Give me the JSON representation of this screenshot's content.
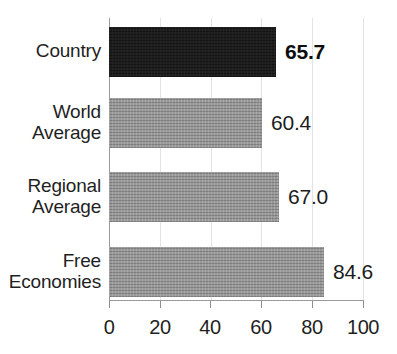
{
  "chart_data": {
    "type": "bar",
    "orientation": "horizontal",
    "title": "",
    "subtitle": "",
    "xlabel": "",
    "ylabel": "",
    "xlim": [
      0,
      100
    ],
    "xticks": [
      "0",
      "20",
      "40",
      "60",
      "80",
      "100"
    ],
    "grid": true,
    "legend": null,
    "categories": [
      "Country",
      "World Average",
      "Regional Average",
      "Free Economies"
    ],
    "values": [
      65.7,
      60.4,
      67.0,
      84.6
    ],
    "value_labels": [
      "65.7",
      "60.4",
      "67.0",
      "84.6"
    ],
    "colors": {
      "highlight_bar": "#141414",
      "default_bar": "#8d8d8d",
      "gridline": "#e3e3e3",
      "axis": "#9a9a9a",
      "text": "#1f1f1f",
      "background": "#ffffff"
    },
    "bars": [
      {
        "category": "Country",
        "label_lines": [
          "Country"
        ],
        "value": 65.7,
        "value_label": "65.7",
        "style": "highlight",
        "emphasis": "bold"
      },
      {
        "category": "World Average",
        "label_lines": [
          "World",
          "Average"
        ],
        "value": 60.4,
        "value_label": "60.4",
        "style": "default",
        "emphasis": "normal"
      },
      {
        "category": "Regional Average",
        "label_lines": [
          "Regional",
          "Average"
        ],
        "value": 67.0,
        "value_label": "67.0",
        "style": "default",
        "emphasis": "normal"
      },
      {
        "category": "Free Economies",
        "label_lines": [
          "Free",
          "Economies"
        ],
        "value": 84.6,
        "value_label": "84.6",
        "style": "default",
        "emphasis": "normal"
      }
    ]
  }
}
